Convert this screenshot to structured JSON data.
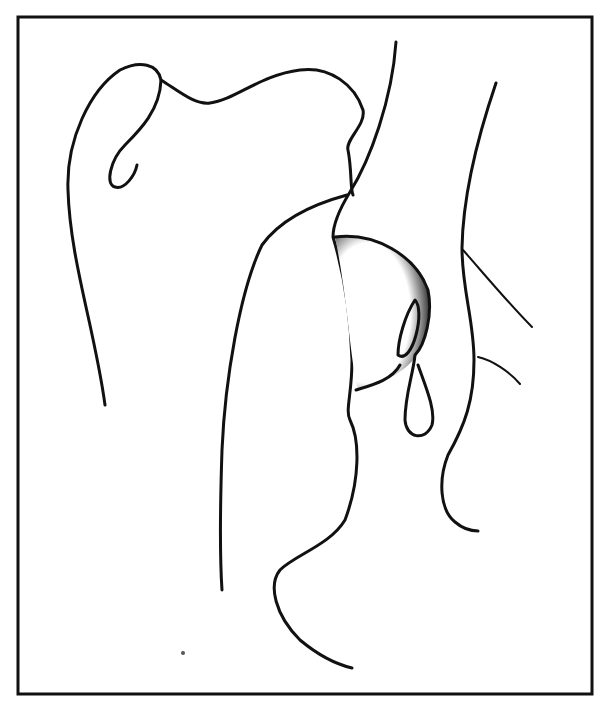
{
  "figure": {
    "type": "anatomical line illustration",
    "frame": {
      "x": 18,
      "y": 17,
      "width": 574,
      "height": 677,
      "stroke": "#111111"
    },
    "background": "#ffffff",
    "ink_color": "#111111",
    "labels": []
  }
}
